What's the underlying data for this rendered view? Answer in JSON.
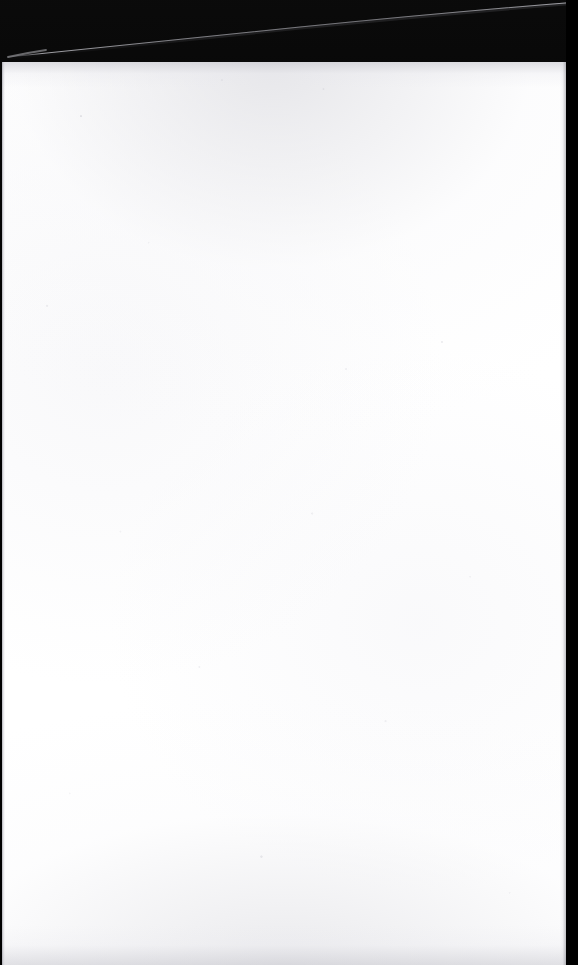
{
  "document": {
    "kind": "scanned-page",
    "page_content": "",
    "content_state": "blank",
    "has_text": false,
    "has_figures": false,
    "orientation": "portrait"
  },
  "canvas": {
    "width_px": 578,
    "height_px": 965
  },
  "scanner_bed": {
    "name": "scanner-bed",
    "color": "#010101",
    "top_band_height_px": 62,
    "right_bar_width_px": 12
  },
  "page_sheet": {
    "name": "page-sheet",
    "color": "#ffffff",
    "left_px": 2,
    "top_px": 62,
    "width_px": 564,
    "height_px": 903
  },
  "artifacts": {
    "diagonal_edge_streak": {
      "name": "page-edge-streak",
      "color": "#8f8f94",
      "from_x_px": 10,
      "from_y_px": 56,
      "to_x_px": 578,
      "to_y_px": 2
    },
    "gutter_line": {
      "name": "gutter-shadow-line",
      "color": "#96969e",
      "x_px": 2,
      "width_px": 3
    },
    "top_edge_shade_color": "#c4c4cb",
    "bottom_edge_shade_color": "#c6c6cd",
    "speckle_color": "#d6d6dc"
  }
}
